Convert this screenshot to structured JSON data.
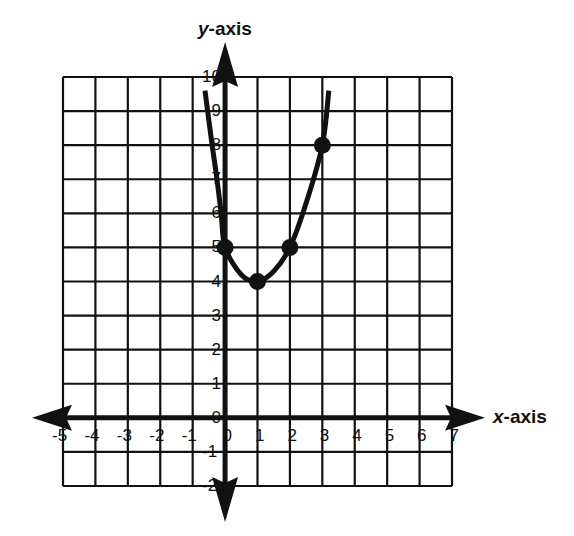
{
  "chart_data": {
    "type": "line",
    "title": "",
    "xlabel": "x-axis",
    "ylabel": "y-axis",
    "xlim": [
      -5,
      7
    ],
    "ylim": [
      -2,
      10
    ],
    "grid": true,
    "x_ticks": [
      "-5",
      "-4",
      "-3",
      "-2",
      "-1",
      "0",
      "1",
      "2",
      "3",
      "4",
      "5",
      "6",
      "7"
    ],
    "y_ticks": [
      "-2",
      "-1",
      "0",
      "1",
      "2",
      "3",
      "4",
      "5",
      "6",
      "7",
      "8",
      "9",
      "10"
    ],
    "series": [
      {
        "name": "parabola",
        "curve_points": [
          {
            "x": -0.62,
            "y": 9.6
          },
          {
            "x": -0.4,
            "y": 8.0
          },
          {
            "x": -0.25,
            "y": 7.0
          },
          {
            "x": -0.12,
            "y": 6.0
          },
          {
            "x": 0,
            "y": 5
          },
          {
            "x": 0.5,
            "y": 4.2
          },
          {
            "x": 1,
            "y": 4
          },
          {
            "x": 1.5,
            "y": 4.3
          },
          {
            "x": 2,
            "y": 5
          },
          {
            "x": 2.5,
            "y": 6.3
          },
          {
            "x": 3,
            "y": 8
          },
          {
            "x": 3.2,
            "y": 9.6
          }
        ],
        "marked_points": [
          {
            "x": 0,
            "y": 5
          },
          {
            "x": 1,
            "y": 4
          },
          {
            "x": 2,
            "y": 5
          },
          {
            "x": 3,
            "y": 8
          }
        ]
      }
    ]
  },
  "labels": {
    "x_axis": "x-axis",
    "y_axis": "y-axis",
    "x_axis_italic": "x",
    "x_axis_rest": "-axis",
    "y_axis_italic": "y",
    "y_axis_rest": "-axis"
  },
  "colors": {
    "ink": "#111111",
    "background": "#ffffff"
  }
}
